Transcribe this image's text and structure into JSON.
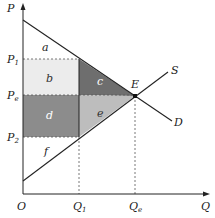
{
  "diagram": {
    "type": "supply-demand-surplus",
    "axes": {
      "y_label": "P",
      "x_label": "Q",
      "origin_label": "O"
    },
    "price_labels": [
      {
        "main": "P",
        "sub": "1"
      },
      {
        "main": "P",
        "sub": "e"
      },
      {
        "main": "P",
        "sub": "2"
      }
    ],
    "quantity_labels": [
      {
        "main": "Q",
        "sub": "1"
      },
      {
        "main": "Q",
        "sub": "e"
      }
    ],
    "curves": {
      "supply": "S",
      "demand": "D"
    },
    "equilibrium_label": "E",
    "regions": [
      {
        "label": "a",
        "color": "#ffffff"
      },
      {
        "label": "b",
        "color": "#ececec"
      },
      {
        "label": "c",
        "color": "#6e6e6e"
      },
      {
        "label": "d",
        "color": "#8c8c8c"
      },
      {
        "label": "e",
        "color": "#bdbdbd"
      },
      {
        "label": "f",
        "color": "#ffffff"
      }
    ],
    "colors": {
      "line": "#222222",
      "dashed": "#555555"
    }
  }
}
